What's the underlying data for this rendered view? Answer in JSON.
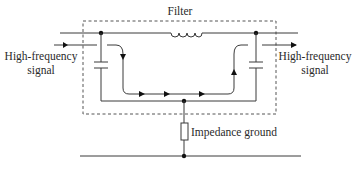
{
  "diagram": {
    "title": "Filter",
    "labels": {
      "input_signal_line1": "High-frequency",
      "input_signal_line2": "signal",
      "output_signal_line1": "High-frequency",
      "output_signal_line2": "signal",
      "impedance": "Impedance ground"
    },
    "components": [
      {
        "type": "inductor",
        "name": "series-inductor"
      },
      {
        "type": "capacitor",
        "name": "input-shunt-capacitor"
      },
      {
        "type": "capacitor",
        "name": "output-shunt-capacitor"
      },
      {
        "type": "resistor",
        "name": "impedance-ground"
      }
    ],
    "colors": {
      "line": "#3a3a3a",
      "background": "#ffffff"
    }
  }
}
